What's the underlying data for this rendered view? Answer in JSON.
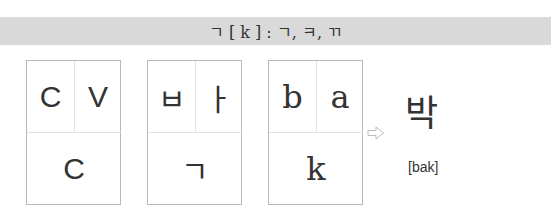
{
  "header": {
    "title": "ㄱ [ k ] : ㄱ, ㅋ, ㄲ"
  },
  "cards": [
    {
      "name": "pattern",
      "top_left": "C",
      "top_right": "V",
      "bottom": "C"
    },
    {
      "name": "hangul",
      "top_left": "ㅂ",
      "top_right": "ㅏ",
      "bottom": "ㄱ"
    },
    {
      "name": "roman",
      "top_left": "b",
      "top_right": "a",
      "bottom": "k"
    }
  ],
  "arrow": {
    "icon": "right-arrow-outline-icon",
    "color": "#bdbdbd"
  },
  "result": {
    "syllable": "박",
    "romanization": "[bak]"
  },
  "colors": {
    "header_bg": "#d9d9d9",
    "card_border": "#b8b8b8",
    "divider": "#e2e2e2",
    "text": "#333333"
  }
}
